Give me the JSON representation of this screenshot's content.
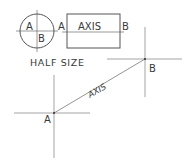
{
  "colors": {
    "line": "#555555",
    "text": "#3a3a3a",
    "background": "#ffffff"
  },
  "circle_view": {
    "label_a": "A",
    "label_b": "B",
    "center": [
      37,
      31
    ],
    "radius": 17
  },
  "rect_view": {
    "label_left": "A",
    "label_right": "B",
    "axis_label": "AXIS",
    "rect": {
      "x": 67,
      "y": 14,
      "w": 53,
      "h": 34
    },
    "axis_y": 32
  },
  "scale_note": "HALF SIZE",
  "oblique_view": {
    "point_a": {
      "label": "A",
      "x": 54,
      "y": 113
    },
    "point_b": {
      "label": "B",
      "x": 145,
      "y": 59
    },
    "axis_label": "AXIS"
  }
}
